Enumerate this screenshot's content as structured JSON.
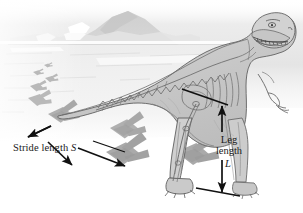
{
  "figure": {
    "background_description": "faded grey mountain landscape with horizon band"
  },
  "annotations": {
    "stride": {
      "text": "Stride length",
      "symbol": "S",
      "full_label": "Stride length S",
      "arrow_type": "double-headed-diagonal"
    },
    "leg": {
      "line1": "Leg",
      "line2": "length",
      "symbol": "L",
      "full_label": "Leg length L",
      "arrow_type": "double-headed-vertical"
    }
  },
  "colors": {
    "ink": "#1a1a1a",
    "body_fill": "#c9c9c9",
    "body_fill_light": "#d8d8d8",
    "body_outline": "#555555",
    "bone_line": "#6b6b6b",
    "mountain": "#d2d2d2",
    "haze": "#e6e6e6",
    "ground": "#efefef",
    "footprint": "#b3b3b3",
    "footprint_dark": "#9a9a9a",
    "paper": "#ffffff"
  },
  "elements": {
    "dinosaur": "tyrannosaurus-rex",
    "footprints_near": 3,
    "footprints_far": 5,
    "skeleton_visible": true
  }
}
